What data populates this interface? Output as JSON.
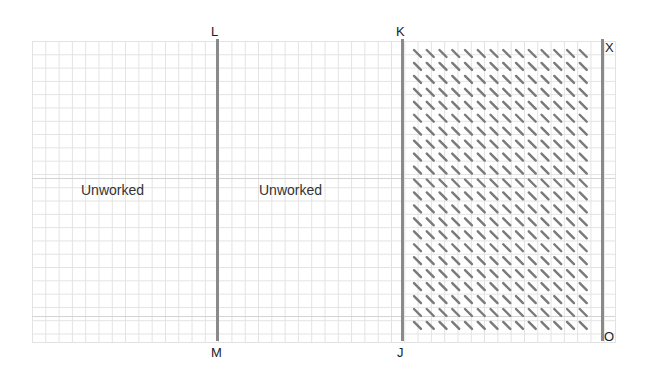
{
  "diagram": {
    "type": "knitting/stitch grid diagram",
    "points": {
      "top": [
        {
          "id": "L",
          "label": "L"
        },
        {
          "id": "K",
          "label": "K"
        },
        {
          "id": "X",
          "label": "X"
        }
      ],
      "bottom": [
        {
          "id": "M",
          "label": "M"
        },
        {
          "id": "J",
          "label": "J"
        },
        {
          "id": "O",
          "label": "O"
        }
      ]
    },
    "regions": [
      {
        "id": "left",
        "label": "Unworked",
        "bounds": "left edge to L–M"
      },
      {
        "id": "middle",
        "label": "Unworked",
        "bounds": "L–M to K–J"
      },
      {
        "id": "right",
        "label": "",
        "bounds": "K–J to X–O",
        "fill": "diagonal hatch stitches"
      }
    ],
    "seams": [
      {
        "from": "L",
        "to": "M"
      },
      {
        "from": "K",
        "to": "J"
      },
      {
        "from": "X",
        "to": "O"
      }
    ],
    "hatch": {
      "columns": 14,
      "rows": 22,
      "color": "#7a7a7a"
    },
    "colors": {
      "grid": "#e2e2e2",
      "seam": "#8a8a8a",
      "hatch": "#7a7a7a",
      "text": "#222222"
    }
  }
}
